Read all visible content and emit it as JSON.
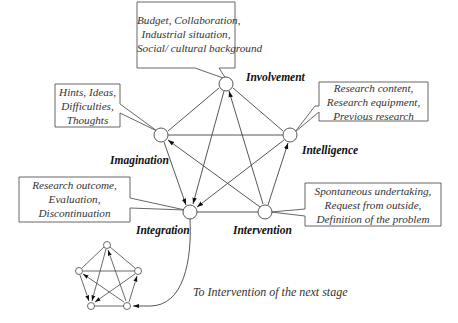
{
  "nodes": {
    "involvement": {
      "label": "Involvement",
      "callout": [
        "Budget, Collaboration,",
        "Industrial situation,",
        "Social/ cultural background"
      ]
    },
    "imagination": {
      "label": "Imagination",
      "callout": [
        "Hints, Ideas,",
        "Difficulties,",
        "Thoughts"
      ]
    },
    "intelligence": {
      "label": "Intelligence",
      "callout": [
        "Research content,",
        "Research equipment,",
        "Previous research"
      ]
    },
    "integration": {
      "label": "Integration",
      "callout": [
        "Research outcome,",
        "Evaluation,",
        "Discontinuation"
      ]
    },
    "intervention": {
      "label": "Intervention",
      "callout": [
        "Spontaneous undertaking,",
        "Request from outside,",
        "Definition of the problem"
      ]
    }
  },
  "caption": "To Intervention of the next stage",
  "colors": {
    "line": "#444444",
    "box": "#555555",
    "arrow": "#111111"
  }
}
